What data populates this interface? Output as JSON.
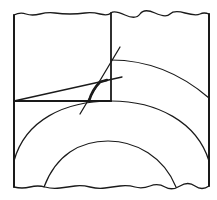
{
  "diagram": {
    "colors": {
      "stroke": "#1a1a1a",
      "background": "#ffffff"
    },
    "elements": [
      {
        "id": "outer-frame",
        "kind": "rectangle",
        "note": "wavy top and bottom edges (break lines)"
      },
      {
        "id": "vertical-divider",
        "kind": "line"
      },
      {
        "id": "horizontal-base-line",
        "kind": "line"
      },
      {
        "id": "sloped-line",
        "kind": "line"
      },
      {
        "id": "steep-line",
        "kind": "line"
      },
      {
        "id": "upper-arc",
        "kind": "arc"
      },
      {
        "id": "middle-arc",
        "kind": "arc"
      },
      {
        "id": "inner-arc",
        "kind": "arc"
      },
      {
        "id": "highlighted-curve",
        "kind": "arc-segment"
      }
    ]
  }
}
